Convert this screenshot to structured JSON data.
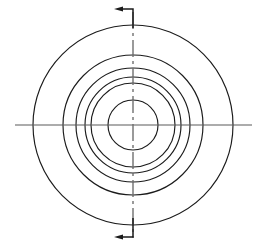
{
  "drawing": {
    "title": "Concentric Circles Section View",
    "kind": "engineering-drawing",
    "canvas": {
      "width": 265,
      "height": 250,
      "background": "#ffffff"
    },
    "center": {
      "x": 133,
      "y": 125
    },
    "colors": {
      "outline": "#1b1b1b",
      "centerline_horizontal": "#5a5a5a",
      "centerline_vertical": "#6a6a6a",
      "arrow": "#1b1b1b",
      "background": "#ffffff"
    },
    "circles": [
      {
        "name": "outermost-circle",
        "radius": 100,
        "label": "circle-1"
      },
      {
        "name": "circle-2",
        "radius": 70,
        "label": "circle-2"
      },
      {
        "name": "circle-3",
        "radius": 57,
        "label": "circle-3"
      },
      {
        "name": "circle-4",
        "radius": 48,
        "label": "circle-4"
      },
      {
        "name": "circle-5",
        "radius": 42,
        "label": "circle-5"
      },
      {
        "name": "innermost-circle",
        "radius": 25,
        "label": "circle-6"
      }
    ],
    "centerlines": {
      "horizontal": {
        "x1": 15,
        "y1": 125,
        "x2": 252,
        "y2": 125,
        "style": "continuous-thin"
      },
      "vertical": {
        "x1": 133,
        "y1": 12,
        "x2": 133,
        "y2": 238,
        "style": "dash-dot"
      }
    },
    "section_arrows": [
      {
        "name": "section-arrow-top",
        "direction": "left",
        "corner": {
          "x": 133,
          "y": 9
        },
        "tip": {
          "x": 114,
          "y": 9
        },
        "stem_to": {
          "x": 133,
          "y": 28
        }
      },
      {
        "name": "section-arrow-bottom",
        "direction": "left",
        "corner": {
          "x": 133,
          "y": 237
        },
        "tip": {
          "x": 114,
          "y": 237
        },
        "stem_to": {
          "x": 133,
          "y": 218
        }
      }
    ]
  }
}
